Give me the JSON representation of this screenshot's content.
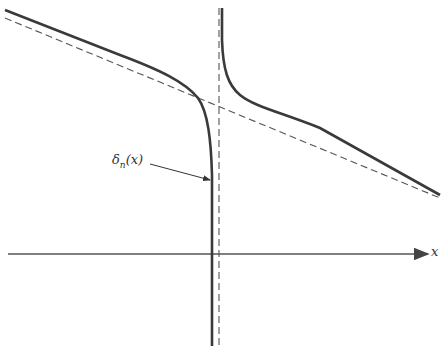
{
  "diagram": {
    "axis_label": "x",
    "curve_label": "δ",
    "curve_label_sub": "n",
    "curve_label_arg": "(x)",
    "colors": {
      "curve": "#3a3a3a",
      "dashed": "#555555",
      "axis": "#555555",
      "background": "#ffffff"
    },
    "elements": [
      {
        "type": "x-axis",
        "from": [
          8,
          254
        ],
        "to": [
          428,
          254
        ],
        "arrow": true
      },
      {
        "type": "asymptote-vertical",
        "x": 219,
        "style": "dashed"
      },
      {
        "type": "asymptote-oblique",
        "from": [
          5,
          18
        ],
        "to": [
          440,
          198
        ],
        "style": "dashed"
      },
      {
        "type": "curve-left-branch",
        "description": "approaches oblique line on left, plunges downward near x=212"
      },
      {
        "type": "curve-right-branch",
        "description": "descends from top near x=222, approaches oblique line on right"
      },
      {
        "type": "annotation-arrow",
        "from": [
          150,
          163
        ],
        "to": [
          212,
          180
        ],
        "label": "δn(x)"
      }
    ]
  }
}
